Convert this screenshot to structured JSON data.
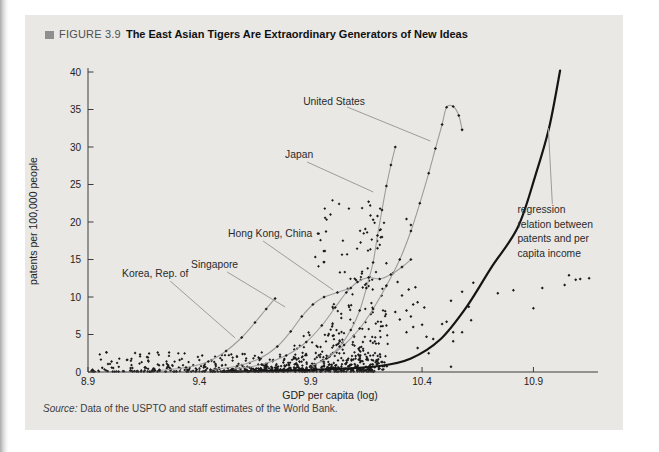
{
  "figure": {
    "label": "FIGURE 3.9",
    "title": "The East Asian Tigers Are Extraordinary Generators of New Ideas",
    "marker_color": "#8f8f8f"
  },
  "source": {
    "prefix": "Source:",
    "text": " Data of the USPTO and staff estimates of the World Bank."
  },
  "chart_data": {
    "type": "scatter",
    "xlabel": "GDP per capita (log)",
    "ylabel": "patents per 100,000 people",
    "xlim": [
      8.9,
      11.19
    ],
    "ylim": [
      0,
      40
    ],
    "xticks": [
      {
        "v": 8.9,
        "label": "8.9"
      },
      {
        "v": 9.4,
        "label": "9.4"
      },
      {
        "v": 9.9,
        "label": "9.9"
      },
      {
        "v": 10.4,
        "label": "10.4"
      },
      {
        "v": 10.9,
        "label": "10.9"
      }
    ],
    "yticks": [
      0,
      5,
      10,
      15,
      20,
      25,
      30,
      35,
      40
    ],
    "grid": false,
    "legend_position": "none",
    "colors": {
      "points": "#1b1b1b",
      "trajectory": "#9c9c9c",
      "regression": "#151515",
      "axis": "#3c3c3c",
      "text": "#222222",
      "panel_bg": "#e9e8e5"
    },
    "series": [
      {
        "name": "United States",
        "points": [
          [
            9.98,
            2.0
          ],
          [
            10.05,
            3.6
          ],
          [
            10.12,
            5.8
          ],
          [
            10.18,
            8.4
          ],
          [
            10.24,
            11.5
          ],
          [
            10.3,
            15.0
          ],
          [
            10.35,
            18.8
          ],
          [
            10.39,
            22.5
          ],
          [
            10.43,
            26.5
          ],
          [
            10.46,
            29.8
          ],
          [
            10.49,
            33.0
          ],
          [
            10.51,
            35.3
          ],
          [
            10.54,
            35.4
          ],
          [
            10.565,
            34.2
          ],
          [
            10.58,
            32.3
          ]
        ]
      },
      {
        "name": "Japan",
        "points": [
          [
            9.9,
            0.8
          ],
          [
            9.97,
            1.8
          ],
          [
            10.03,
            3.4
          ],
          [
            10.08,
            5.6
          ],
          [
            10.12,
            8.2
          ],
          [
            10.15,
            11.2
          ],
          [
            10.18,
            14.6
          ],
          [
            10.2,
            18.2
          ],
          [
            10.22,
            21.6
          ],
          [
            10.24,
            24.8
          ],
          [
            10.26,
            27.6
          ],
          [
            10.28,
            30.0
          ]
        ]
      },
      {
        "name": "Hong Kong, China",
        "points": [
          [
            9.55,
            0.4
          ],
          [
            9.68,
            1.0
          ],
          [
            9.79,
            2.2
          ],
          [
            9.88,
            4.0
          ],
          [
            9.95,
            6.2
          ],
          [
            10.01,
            8.6
          ],
          [
            10.06,
            10.6
          ],
          [
            10.11,
            12.0
          ],
          [
            10.16,
            12.6
          ],
          [
            10.21,
            12.4
          ],
          [
            10.26,
            13.0
          ],
          [
            10.31,
            14.0
          ],
          [
            10.35,
            15.0
          ]
        ]
      },
      {
        "name": "Singapore",
        "points": [
          [
            9.45,
            0.3
          ],
          [
            9.57,
            0.8
          ],
          [
            9.67,
            1.8
          ],
          [
            9.75,
            3.4
          ],
          [
            9.81,
            5.4
          ],
          [
            9.86,
            7.4
          ],
          [
            9.91,
            9.0
          ],
          [
            9.96,
            10.0
          ],
          [
            10.02,
            10.6
          ],
          [
            10.08,
            11.2
          ]
        ]
      },
      {
        "name": "Korea, Rep. of",
        "points": [
          [
            9.22,
            0.2
          ],
          [
            9.34,
            0.6
          ],
          [
            9.44,
            1.4
          ],
          [
            9.52,
            2.8
          ],
          [
            9.59,
            4.6
          ],
          [
            9.65,
            6.6
          ],
          [
            9.7,
            8.4
          ],
          [
            9.74,
            9.8
          ]
        ]
      }
    ],
    "country_labels": [
      {
        "text": "United States",
        "pos": [
          9.866,
          35.6
        ],
        "leader": [
          [
            10.064,
            35.33
          ],
          [
            10.437,
            30.8
          ]
        ]
      },
      {
        "text": "Japan",
        "pos": [
          9.785,
          28.5
        ],
        "leader": [
          [
            9.884,
            28.0
          ],
          [
            10.181,
            24.0
          ]
        ]
      },
      {
        "text": "Hong Kong, China",
        "pos": [
          9.529,
          18.0
        ],
        "leader": [
          [
            9.686,
            17.47
          ],
          [
            10.001,
            10.93
          ]
        ]
      },
      {
        "text": "Singapore",
        "pos": [
          9.363,
          13.9
        ],
        "leader": [
          [
            9.525,
            13.33
          ],
          [
            9.785,
            8.67
          ]
        ]
      },
      {
        "text": "Korea, Rep. of",
        "pos": [
          9.053,
          12.7
        ],
        "leader": [
          [
            9.269,
            12.13
          ],
          [
            9.561,
            4.53
          ]
        ]
      }
    ],
    "regression": {
      "points": [
        [
          9.5,
          0.05
        ],
        [
          9.75,
          0.15
        ],
        [
          10.0,
          0.4
        ],
        [
          10.21,
          0.8
        ],
        [
          10.35,
          1.8
        ],
        [
          10.48,
          4.3
        ],
        [
          10.6,
          8.7
        ],
        [
          10.71,
          13.9
        ],
        [
          10.83,
          19.3
        ],
        [
          10.91,
          26.3
        ],
        [
          10.97,
          32.5
        ],
        [
          11.02,
          40.2
        ]
      ],
      "label_lines": [
        "regression",
        "relation between",
        "patents and per",
        "capita income"
      ],
      "label_pos": [
        10.828,
        22.0
      ],
      "leader": [
        [
          10.985,
          22.4
        ],
        [
          10.967,
          32.53
        ]
      ]
    },
    "extra_points": [
      [
        11.06,
        12.9
      ],
      [
        11.09,
        12.3
      ],
      [
        11.11,
        12.4
      ],
      [
        11.15,
        12.5
      ],
      [
        11.04,
        11.6
      ],
      [
        10.94,
        11.2
      ],
      [
        10.81,
        10.9
      ],
      [
        10.74,
        10.5
      ],
      [
        10.9,
        8.5
      ],
      [
        10.63,
        11.9
      ],
      [
        10.58,
        10.7
      ],
      [
        10.53,
        9.5
      ],
      [
        10.61,
        8.7
      ],
      [
        10.62,
        6.9
      ],
      [
        10.51,
        6.7
      ],
      [
        10.49,
        6.4
      ],
      [
        10.54,
        5.3
      ],
      [
        10.58,
        5.3
      ],
      [
        10.54,
        4.1
      ],
      [
        10.53,
        0.7
      ],
      [
        10.43,
        2.5
      ],
      [
        10.38,
        3.2
      ],
      [
        10.33,
        5.3
      ],
      [
        10.36,
        6.0
      ],
      [
        10.4,
        6.3
      ],
      [
        10.42,
        4.7
      ],
      [
        10.45,
        4.4
      ],
      [
        10.33,
        8.2
      ],
      [
        10.36,
        9.0
      ],
      [
        10.38,
        9.3
      ],
      [
        10.41,
        8.6
      ],
      [
        10.35,
        7.4
      ],
      [
        10.3,
        7.0
      ],
      [
        10.28,
        8.0
      ],
      [
        10.31,
        10.2
      ],
      [
        10.34,
        11.0
      ],
      [
        10.37,
        11.3
      ],
      [
        10.29,
        12.0
      ],
      [
        10.27,
        13.2
      ],
      [
        10.24,
        14.5
      ],
      [
        10.2,
        16.5
      ],
      [
        10.22,
        18.0
      ],
      [
        10.18,
        20.3
      ],
      [
        10.2,
        20.8
      ],
      [
        10.16,
        22.7
      ],
      [
        10.33,
        20.4
      ],
      [
        10.35,
        19.6
      ]
    ],
    "cloud": {
      "description": "dense unlabeled country-year observations hugging the x-axis and fanning upward toward high incomes",
      "seed": 20061114,
      "clusters": [
        {
          "kind": "band",
          "n": 480,
          "x_base": 8.9,
          "x_span": 1.3,
          "x_pow": 0.75,
          "y_base": 0.05,
          "y_span": 2.6,
          "y_pow": 3.2
        },
        {
          "kind": "fan",
          "n": 300,
          "x_base": 9.55,
          "x_span": 0.7,
          "x_pow": 0.6,
          "y_base": 0.3,
          "env_scale": 24,
          "env_pow": 2.2,
          "env_x0": 9.5,
          "env_xw": 0.78,
          "y_pow": 2.4
        },
        {
          "kind": "band",
          "n": 40,
          "x_base": 9.92,
          "x_span": 0.32,
          "x_pow": 1.0,
          "y_base": 12.5,
          "y_span": 10.5,
          "y_pow": 1.0
        }
      ]
    }
  }
}
